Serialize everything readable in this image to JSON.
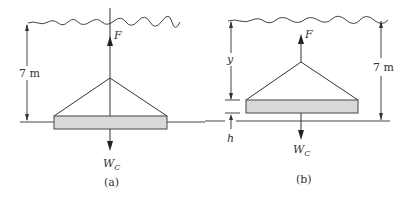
{
  "figure": {
    "panels": [
      {
        "id": "a",
        "caption": "(a)",
        "force_up_label": "F",
        "weight_label": "W",
        "weight_subscript": "C",
        "dimension_label": "7 m"
      },
      {
        "id": "b",
        "caption": "(b)",
        "force_up_label": "F",
        "weight_label": "W",
        "weight_subscript": "C",
        "dimension_label": "7 m",
        "depth_label": "y",
        "gap_label": "h"
      }
    ],
    "colors": {
      "line": "#333333",
      "slab_fill": "#d9d9d9",
      "background": "#ffffff"
    }
  }
}
